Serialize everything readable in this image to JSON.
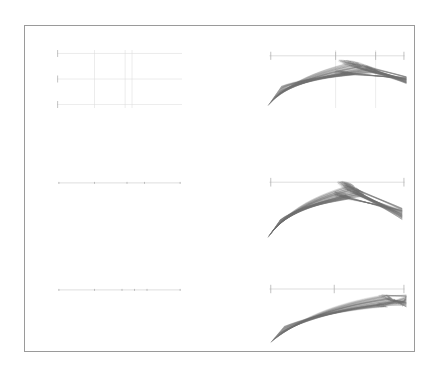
{
  "figure": {
    "background_color": "#ffffff",
    "frame": {
      "x": 24,
      "y": 25,
      "width": 391,
      "height": 327,
      "stroke_color": "#9a9a9a",
      "stroke_width": 1
    },
    "text_content": "",
    "has_title": false,
    "has_axis_labels": false,
    "has_tick_labels": false,
    "has_legend": false,
    "grid_rows": 3,
    "grid_cols": 2
  },
  "chart_data": {
    "type": "line",
    "title": "",
    "subtitle": "",
    "xlabel": "",
    "ylabel": "",
    "legend_position": "none",
    "grid": true,
    "palette": {
      "frame": "#9a9a9a",
      "axis": "#c8c8c8",
      "grid": "#dcdcdc",
      "tick": "#a8a8a8",
      "bundle": "#6f6f6f"
    },
    "panels": [
      {
        "id": "panel-r1c1",
        "row": 1,
        "col": 1,
        "kind": "axes-only",
        "x": 57,
        "y": 50,
        "width": 125,
        "height": 58,
        "xlim": [
          0,
          1
        ],
        "ylim": [
          0,
          1
        ],
        "grid": true,
        "h_rules": [
          0.06,
          0.5,
          0.94
        ],
        "v_rules": [
          0.3,
          0.545,
          0.6
        ],
        "left_ticks": [
          0.06,
          0.5,
          0.94
        ],
        "series": []
      },
      {
        "id": "panel-r1c2",
        "row": 1,
        "col": 2,
        "kind": "curve-bundle",
        "x": 268,
        "y": 50,
        "width": 138,
        "height": 58,
        "xlim": [
          0,
          1
        ],
        "ylim": [
          0,
          1
        ],
        "grid": false,
        "axis_y": 0.1,
        "x_ticks": [
          0.02,
          0.49,
          0.78,
          0.985
        ],
        "v_rules": [
          0.49,
          0.78
        ],
        "bundle": {
          "n_curves": 110,
          "shape": "broad-arch",
          "x_start_range": [
            0.0,
            0.1
          ],
          "x_end": 1.0,
          "y_start_range": [
            0.62,
            0.96
          ],
          "y_peak_range": [
            0.18,
            0.42
          ],
          "peak_x_range": [
            0.52,
            0.8
          ],
          "y_end_range": [
            0.46,
            0.58
          ],
          "opacity_range": [
            0.22,
            0.6
          ]
        }
      },
      {
        "id": "panel-r2c1",
        "row": 2,
        "col": 1,
        "kind": "axes-only",
        "x": 57,
        "y": 178,
        "width": 125,
        "height": 14,
        "xlim": [
          0,
          1
        ],
        "ylim": [
          0,
          1
        ],
        "grid": false,
        "axis_y": 0.35,
        "x_ticks": [
          0.015,
          0.3,
          0.56,
          0.7,
          0.985
        ],
        "series": []
      },
      {
        "id": "panel-r2c2",
        "row": 2,
        "col": 2,
        "kind": "curve-bundle",
        "x": 268,
        "y": 176,
        "width": 138,
        "height": 62,
        "xlim": [
          0,
          1
        ],
        "ylim": [
          0,
          1
        ],
        "grid": false,
        "axis_y": 0.1,
        "x_ticks": [
          0.02,
          0.985
        ],
        "bundle": {
          "n_curves": 105,
          "shape": "hook",
          "x_start_range": [
            0.0,
            0.09
          ],
          "x_end": 0.97,
          "y_start_range": [
            0.7,
            0.99
          ],
          "y_peak_range": [
            0.1,
            0.34
          ],
          "peak_x_range": [
            0.52,
            0.68
          ],
          "y_end_range": [
            0.52,
            0.7
          ],
          "opacity_range": [
            0.24,
            0.62
          ]
        }
      },
      {
        "id": "panel-r3c1",
        "row": 3,
        "col": 1,
        "kind": "axes-only",
        "x": 57,
        "y": 285,
        "width": 125,
        "height": 14,
        "xlim": [
          0,
          1
        ],
        "ylim": [
          0,
          1
        ],
        "grid": false,
        "axis_y": 0.35,
        "x_ticks": [
          0.015,
          0.3,
          0.52,
          0.62,
          0.72,
          0.985
        ],
        "series": []
      },
      {
        "id": "panel-r3c2",
        "row": 3,
        "col": 2,
        "kind": "curve-bundle",
        "x": 268,
        "y": 283,
        "width": 138,
        "height": 60,
        "xlim": [
          0,
          1
        ],
        "ylim": [
          0,
          1
        ],
        "grid": false,
        "axis_y": 0.1,
        "x_ticks": [
          0.02,
          0.48,
          0.985
        ],
        "bundle": {
          "n_curves": 100,
          "shape": "blade",
          "x_start_range": [
            0.02,
            0.12
          ],
          "x_end": 1.0,
          "y_start_range": [
            0.72,
            0.99
          ],
          "y_peak_range": [
            0.2,
            0.4
          ],
          "peak_x_range": [
            0.8,
            0.99
          ],
          "y_end_range": [
            0.2,
            0.4
          ],
          "opacity_range": [
            0.22,
            0.58
          ]
        }
      }
    ]
  }
}
